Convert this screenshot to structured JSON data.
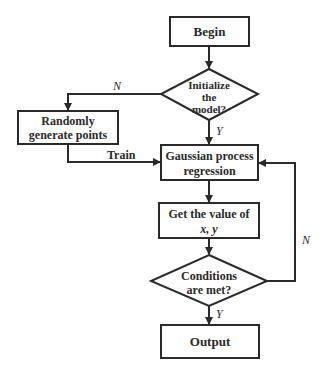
{
  "nodes": {
    "begin": {
      "label": "Begin"
    },
    "init": {
      "lines": [
        "Initialize",
        "the",
        "model?"
      ]
    },
    "random": {
      "lines": [
        "Randomly",
        "generate points"
      ]
    },
    "gpr": {
      "lines": [
        "Gaussian process",
        "regression"
      ]
    },
    "getval": {
      "lines": [
        "Get the value of",
        "x, y"
      ]
    },
    "cond": {
      "lines": [
        "Conditions",
        "are met?"
      ]
    },
    "output": {
      "label": "Output"
    }
  },
  "edges": {
    "init_no": "N",
    "init_yes": "Y",
    "train": "Train",
    "cond_no": "N",
    "cond_yes": "Y"
  },
  "colors": {
    "stroke": "#2a2a2a",
    "background": "#ffffff"
  }
}
